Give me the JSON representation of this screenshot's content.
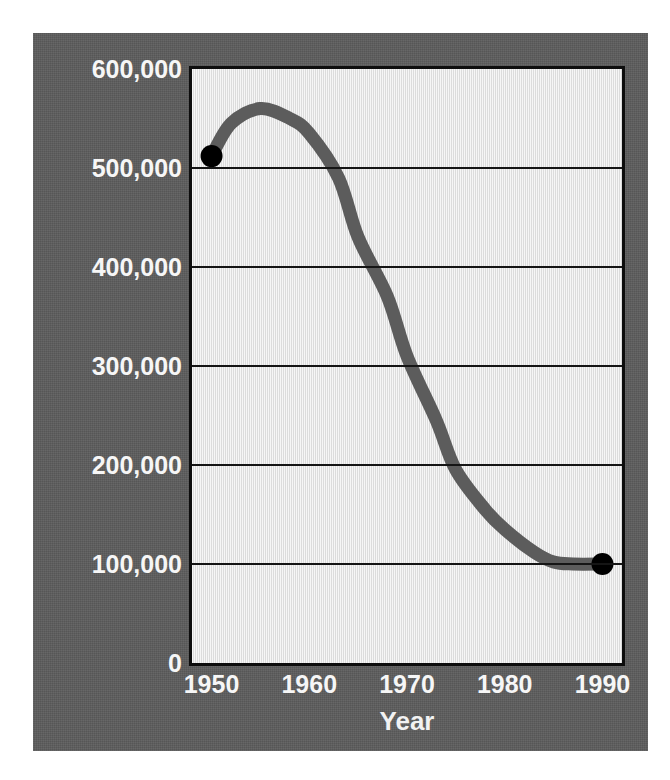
{
  "chart_data": {
    "type": "line",
    "title": "",
    "subtitle": "",
    "xlabel": "Year",
    "ylabel": "Resident patients at end of year",
    "xlim": [
      1948,
      1992
    ],
    "ylim": [
      0,
      600000
    ],
    "grid": "horizontal",
    "legend": "none",
    "line_color": "#5c5c5c",
    "marker_color": "#000000",
    "plot_background": "#ececec",
    "panel_background": "#5c5c5c",
    "tick_label_color": "#f6f6f6",
    "x_ticks": [
      "1950",
      "1960",
      "1970",
      "1980",
      "1990"
    ],
    "x_tick_values": [
      1950,
      1960,
      1970,
      1980,
      1990
    ],
    "y_ticks": [
      "0",
      "100,000",
      "200,000",
      "300,000",
      "400,000",
      "500,000",
      "600,000"
    ],
    "y_tick_values": [
      0,
      100000,
      200000,
      300000,
      400000,
      500000,
      600000
    ],
    "gridline_values": [
      100000,
      200000,
      300000,
      400000,
      500000
    ],
    "series": [
      {
        "name": "Resident patients at end of year",
        "x": [
          1950,
          1952,
          1955,
          1958,
          1960,
          1963,
          1965,
          1968,
          1970,
          1973,
          1975,
          1978,
          1980,
          1983,
          1985,
          1987,
          1990
        ],
        "values": [
          512000,
          545000,
          560000,
          550000,
          535000,
          490000,
          430000,
          370000,
          310000,
          245000,
          195000,
          155000,
          135000,
          112000,
          102000,
          100000,
          100000
        ]
      }
    ],
    "markers": [
      {
        "label": "start",
        "x": 1950,
        "y": 512000
      },
      {
        "label": "end",
        "x": 1990,
        "y": 100000
      }
    ]
  }
}
